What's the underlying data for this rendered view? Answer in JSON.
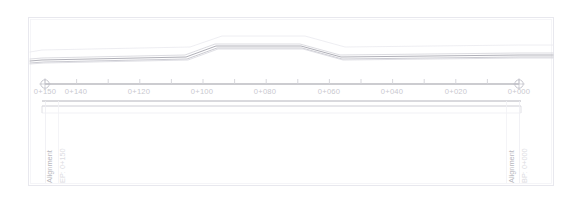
{
  "view": {
    "title": "Road Alignment Plan View",
    "background_color": "#ffffff",
    "frame_color": "#e8e8ee",
    "frame": {
      "x": 28,
      "y": 17,
      "w": 525,
      "h": 168
    }
  },
  "alignment": {
    "begin_marker": {
      "name_label": "Alignment",
      "station_label": "BP: 0+000",
      "x": 519,
      "y": 89,
      "name_color": "#b8b8be",
      "station_color": "#dcdce2"
    },
    "end_marker": {
      "name_label": "Alignment",
      "station_label": "EP: 0+150",
      "x": 45,
      "y": 89,
      "name_color": "#b8b8be",
      "station_color": "#dcdce2"
    },
    "centerline_color": "#9a9aa2",
    "station_axis": {
      "y": 84,
      "x_start": 45,
      "x_end": 519,
      "tick_color": "#d2d2d8",
      "tick_spacing_m": 10,
      "major_labels": [
        {
          "text": "0+150",
          "x": 45
        },
        {
          "text": "0+140",
          "x": 76
        },
        {
          "text": "0+120",
          "x": 139
        },
        {
          "text": "0+100",
          "x": 202
        },
        {
          "text": "0+080",
          "x": 265
        },
        {
          "text": "0+060",
          "x": 329
        },
        {
          "text": "0+040",
          "x": 392
        },
        {
          "text": "0+020",
          "x": 456
        },
        {
          "text": "0+000",
          "x": 519
        }
      ],
      "label_y": 87,
      "label_color": "#c9c9cf"
    }
  },
  "corridor": {
    "description": "Road corridor edges with widening bulge near mid-station",
    "lines": [
      {
        "name": "outer-top-edge",
        "color": "#ececf1",
        "width": 0.9,
        "points": "30,52 42,50 190,47 222,36 305,36 345,47 520,45 553,45"
      },
      {
        "name": "inner-top-edge",
        "color": "#d8d8de",
        "width": 0.9,
        "points": "30,59 42,58 185,55 215,44 300,44 340,55 520,53 553,53"
      },
      {
        "name": "centerline-primary",
        "color": "#b0b0b8",
        "width": 1.0,
        "points": "30,61 42,60 186,57 216,46 301,46 341,57 521,55 553,55"
      },
      {
        "name": "inner-bottom-edge",
        "color": "#c4c4cc",
        "width": 0.9,
        "points": "30,63 44,62 187,59 217,48 302,48 342,59 521,57 553,57"
      },
      {
        "name": "outer-bottom-edge",
        "color": "#dcdce2",
        "width": 0.9,
        "points": "30,64 44,63 188,60 218,49 303,49 343,60 522,58 553,58"
      }
    ]
  },
  "baselines": {
    "color_strong": "#b4b4bc",
    "color_faint": "#e4e4ea",
    "lines": [
      {
        "name": "baseline-upper",
        "y": 101,
        "x1": 42,
        "x2": 521,
        "color": "#b4b4bc",
        "width": 1.0
      },
      {
        "name": "baseline-lower",
        "y": 106,
        "x1": 42,
        "x2": 521,
        "color": "#c8c8d0",
        "width": 0.9
      },
      {
        "name": "baseline-faint",
        "y": 113,
        "x1": 42,
        "x2": 521,
        "color": "#eeeef2",
        "width": 0.8
      }
    ]
  },
  "markers": {
    "endpoint_symbol": "circle-with-crosshair",
    "radius": 4.2,
    "color": "#c0c0c8"
  }
}
